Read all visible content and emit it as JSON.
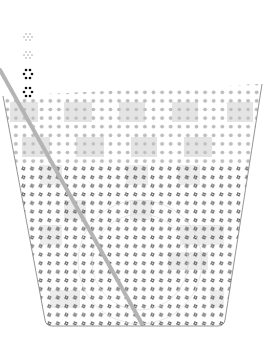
{
  "illustration": {
    "subject": "cup with straw (dotted illustration)",
    "colors": {
      "background": "#ffffff",
      "cup_outline": "#8a8a8a",
      "straw": "#b4b4b4",
      "light_dots": "#bdbdbd",
      "light_blocks": "#e2e2e2",
      "dark_pinwheels": "#3a3a3a",
      "bubble_faint": "#c8c8c8",
      "bubble_dark": "#111111"
    },
    "bubbles": [
      {
        "cx": 28,
        "cy": 37,
        "style": "faint"
      },
      {
        "cx": 28,
        "cy": 55,
        "style": "faint"
      },
      {
        "cx": 28,
        "cy": 74,
        "style": "dark"
      },
      {
        "cx": 28,
        "cy": 92,
        "style": "dark"
      }
    ],
    "cup": {
      "top_left": [
        3,
        96
      ],
      "top_right": [
        262,
        84
      ],
      "bottom_left": [
        46,
        326
      ],
      "bottom_right": [
        224,
        326
      ]
    },
    "straw": {
      "from": [
        0,
        70
      ],
      "to": [
        142,
        324
      ],
      "width": 4
    }
  }
}
